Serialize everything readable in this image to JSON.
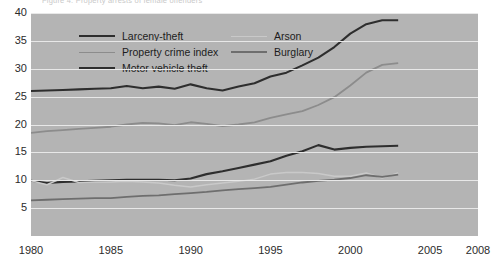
{
  "figure": {
    "title_partial": "Figure 4.  Property arrests of female offenders",
    "background": "#ffffff",
    "plot_background": "#b4b4b4",
    "gridline_color": "#e8e8e8"
  },
  "legend": {
    "position": "top-left inside plot",
    "entries": [
      {
        "label": "Larceny-theft",
        "color": "#2e2e2e",
        "width": 2.1,
        "col": 0,
        "row": 0
      },
      {
        "label": "Property crime index",
        "color": "#8c8c8c",
        "width": 1.9,
        "col": 0,
        "row": 1
      },
      {
        "label": "Motor vehicle theft",
        "color": "#2e2e2e",
        "width": 2.1,
        "col": 0,
        "row": 2
      },
      {
        "label": "Arson",
        "color": "#c9c9c9",
        "width": 1.7,
        "col": 1,
        "row": 0
      },
      {
        "label": "Burglary",
        "color": "#6e6e6e",
        "width": 2.0,
        "col": 1,
        "row": 1
      }
    ]
  },
  "axes": {
    "y_ticks": [
      5,
      10,
      15,
      20,
      25,
      30,
      35,
      40
    ],
    "y_label_strings": [
      "5",
      "10",
      "15",
      "20",
      "25",
      "30",
      "35",
      "40"
    ],
    "x_ticks": [
      1980,
      1985,
      1990,
      1995,
      2000,
      2005,
      2008
    ],
    "x_label_strings": [
      "1980",
      "1985",
      "1990",
      "1995",
      "2000",
      "2005",
      "2008"
    ]
  },
  "chart_data": {
    "type": "line",
    "title": "Figure 4.  Property arrests of female offenders",
    "xlabel": "",
    "ylabel": "",
    "xlim": [
      1980,
      2008
    ],
    "ylim": [
      0,
      40
    ],
    "grid": true,
    "legend_position": "upper left",
    "x": [
      1980,
      1981,
      1982,
      1983,
      1984,
      1985,
      1986,
      1987,
      1988,
      1989,
      1990,
      1991,
      1992,
      1993,
      1994,
      1995,
      1996,
      1997,
      1998,
      1999,
      2000,
      2001,
      2002,
      2003
    ],
    "series": [
      {
        "name": "Larceny-theft",
        "color": "#2e2e2e",
        "values": [
          26.0,
          26.1,
          26.2,
          26.3,
          26.4,
          26.5,
          26.9,
          26.5,
          26.8,
          26.4,
          27.2,
          26.5,
          26.1,
          26.8,
          27.4,
          28.6,
          29.3,
          30.6,
          32.0,
          33.9,
          36.3,
          38.0,
          38.7,
          38.7
        ]
      },
      {
        "name": "Property crime index",
        "color": "#8c8c8c",
        "values": [
          18.5,
          18.8,
          19.0,
          19.2,
          19.4,
          19.6,
          20.0,
          20.3,
          20.2,
          19.9,
          20.4,
          20.1,
          19.7,
          20.0,
          20.4,
          21.2,
          21.8,
          22.4,
          23.5,
          24.9,
          27.0,
          29.3,
          30.7,
          31.0
        ]
      },
      {
        "name": "Motor vehicle theft",
        "color": "#2e2e2e",
        "values": [
          9.9,
          9.5,
          9.7,
          9.8,
          9.9,
          10.0,
          10.1,
          10.1,
          10.1,
          10.0,
          10.3,
          11.1,
          11.6,
          12.2,
          12.8,
          13.4,
          14.4,
          15.2,
          16.3,
          15.5,
          15.8,
          16.0,
          16.1,
          16.2
        ]
      },
      {
        "name": "Arson",
        "color": "#c9c9c9",
        "values": [
          9.9,
          9.2,
          10.5,
          9.6,
          9.7,
          9.7,
          9.8,
          9.7,
          9.5,
          9.1,
          8.8,
          9.2,
          9.5,
          9.8,
          10.2,
          11.1,
          11.4,
          11.4,
          11.2,
          10.7,
          10.7,
          11.3,
          10.4,
          11.3
        ]
      },
      {
        "name": "Burglary",
        "color": "#6e6e6e",
        "values": [
          6.4,
          6.5,
          6.6,
          6.7,
          6.8,
          6.8,
          7.0,
          7.2,
          7.3,
          7.5,
          7.7,
          7.9,
          8.2,
          8.4,
          8.6,
          8.8,
          9.2,
          9.6,
          9.9,
          10.1,
          10.4,
          10.9,
          10.6,
          11.0
        ]
      }
    ]
  }
}
